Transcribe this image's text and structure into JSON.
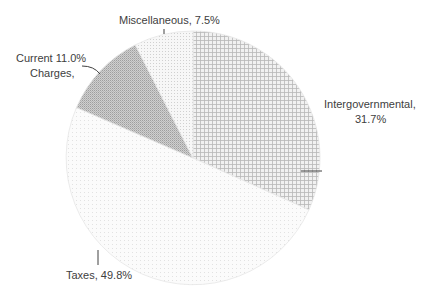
{
  "chart_data": {
    "type": "pie",
    "title": "",
    "categories": [
      "Intergovernmental",
      "Taxes",
      "Current Charges",
      "Miscellaneous"
    ],
    "values": [
      31.7,
      49.8,
      11.0,
      7.5
    ],
    "unit": "%",
    "start_angle": "12 o'clock, clockwise",
    "legend": "none (data labels with leader lines)",
    "labels": [
      {
        "line1": "Intergovernmental,",
        "line2": "31.7%"
      },
      {
        "line1": "Taxes, 49.8%"
      },
      {
        "line1": "Current 11.0%",
        "line2": "Charges,"
      },
      {
        "line1": "Miscellaneous, 7.5%"
      }
    ],
    "fills": [
      "pattern-cross-grid",
      "pattern-light-dots",
      "pattern-dense-gray",
      "pattern-sparse-dots"
    ]
  }
}
